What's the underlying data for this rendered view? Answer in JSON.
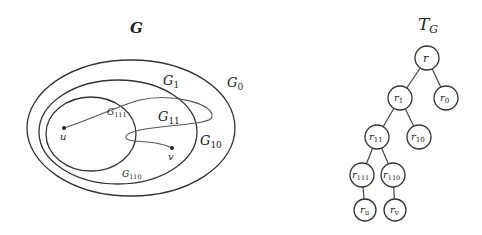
{
  "left_diagram": {
    "title": "G",
    "regions": [
      {
        "id": "G0",
        "label": "G",
        "sub": "0"
      },
      {
        "id": "G1",
        "label": "G",
        "sub": "1"
      },
      {
        "id": "G11",
        "label": "G",
        "sub": "11"
      },
      {
        "id": "G10",
        "label": "G",
        "sub": "10"
      },
      {
        "id": "G111",
        "label": "G",
        "sub": "111"
      },
      {
        "id": "G110",
        "label": "G",
        "sub": "110"
      }
    ],
    "points": [
      {
        "id": "u",
        "label": "u"
      },
      {
        "id": "v",
        "label": "v"
      }
    ]
  },
  "tree": {
    "title": "T",
    "title_sub": "G",
    "nodes": [
      {
        "id": "r",
        "label": "r",
        "sub": ""
      },
      {
        "id": "r1",
        "label": "r",
        "sub": "1"
      },
      {
        "id": "r0",
        "label": "r",
        "sub": "0"
      },
      {
        "id": "r11",
        "label": "r",
        "sub": "11"
      },
      {
        "id": "r10",
        "label": "r",
        "sub": "10"
      },
      {
        "id": "r111",
        "label": "r",
        "sub": "111"
      },
      {
        "id": "r110",
        "label": "r",
        "sub": "110"
      },
      {
        "id": "ru",
        "label": "r",
        "sub": "u"
      },
      {
        "id": "rv",
        "label": "r",
        "sub": "v"
      }
    ],
    "edges": [
      [
        "r",
        "r1"
      ],
      [
        "r",
        "r0"
      ],
      [
        "r1",
        "r11"
      ],
      [
        "r1",
        "r10"
      ],
      [
        "r11",
        "r111"
      ],
      [
        "r11",
        "r110"
      ],
      [
        "r111",
        "ru"
      ],
      [
        "r110",
        "rv"
      ]
    ]
  }
}
